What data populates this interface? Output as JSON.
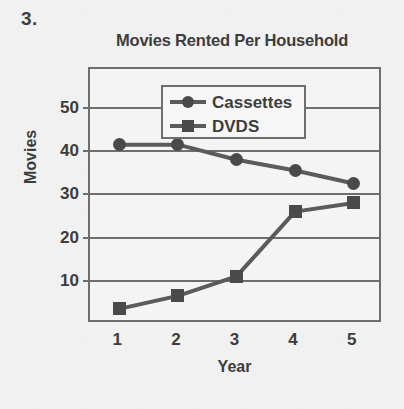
{
  "problem": {
    "number": "3."
  },
  "axis": {
    "y_title": "Movies",
    "x_title": "Year"
  },
  "legend": {
    "position": "inside-top-center",
    "entries": [
      {
        "label": "Cassettes",
        "marker": "circle-marker-icon",
        "color": "#4a4a4a"
      },
      {
        "label": "DVDS",
        "marker": "square-marker-icon",
        "color": "#4a4a4a"
      }
    ]
  },
  "colors": {
    "background": "#f1f1f1",
    "plot_background": "#f4f4f4",
    "ink": "#3d3d3d",
    "line": "#5b5b5b",
    "border": "#6e6e6e",
    "marker": "#4a4a4a"
  },
  "chart_data": {
    "type": "line",
    "title": "Movies Rented Per Household",
    "xlabel": "Year",
    "ylabel": "Movies",
    "x": [
      1,
      2,
      3,
      4,
      5
    ],
    "categories": [
      "1",
      "2",
      "3",
      "4",
      "5"
    ],
    "xlim": [
      0.5,
      5.5
    ],
    "ylim": [
      0,
      59
    ],
    "yticks": [
      10,
      20,
      30,
      40,
      50
    ],
    "ytick_labels": [
      "10",
      "20",
      "30",
      "40",
      "50"
    ],
    "xtick_labels": [
      "1",
      "2",
      "3",
      "4",
      "5"
    ],
    "grid": "horizontal",
    "legend_position": "inside top center",
    "series": [
      {
        "name": "Cassettes",
        "marker": "circle",
        "values": [
          41.5,
          41.5,
          38,
          35.5,
          32.5
        ]
      },
      {
        "name": "DVDS",
        "marker": "square",
        "values": [
          3.5,
          6.5,
          11,
          26,
          28
        ]
      }
    ]
  }
}
